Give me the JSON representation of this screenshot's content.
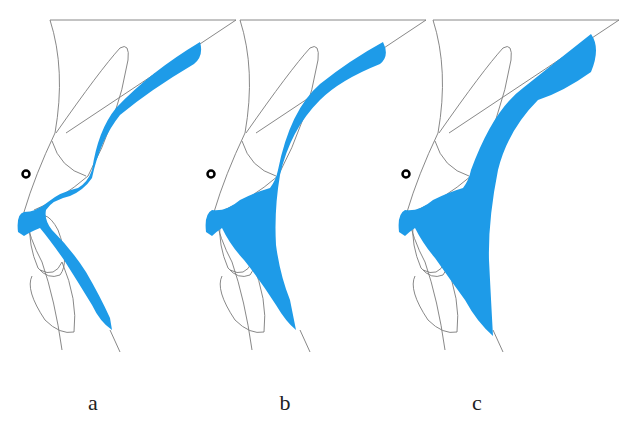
{
  "figure": {
    "panels": [
      {
        "label": "a",
        "x": 93,
        "offset": 0
      },
      {
        "label": "b",
        "x": 285,
        "offset": 190
      },
      {
        "label": "c",
        "x": 477,
        "offset": 383
      }
    ],
    "colors": {
      "fill": "#1e9be8",
      "line": "#7a7a7a",
      "marker": "#000000"
    }
  }
}
